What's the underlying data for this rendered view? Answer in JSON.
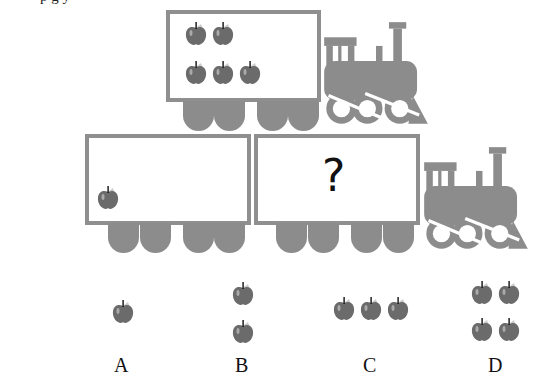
{
  "header": {
    "clipped_text": "      p     g                                                     y"
  },
  "top_train": {
    "car_apples": 5,
    "rows": [
      2,
      3
    ]
  },
  "bottom_train": {
    "car1_apples": 1,
    "car2_content": "?"
  },
  "options": [
    {
      "label": "A",
      "apples": 1
    },
    {
      "label": "B",
      "apples": 2
    },
    {
      "label": "C",
      "apples": 3
    },
    {
      "label": "D",
      "apples": 4
    }
  ],
  "colors": {
    "frame": "#8f8f8f",
    "apple": "#6b6b6b",
    "wheel": "#8c8c8c"
  }
}
